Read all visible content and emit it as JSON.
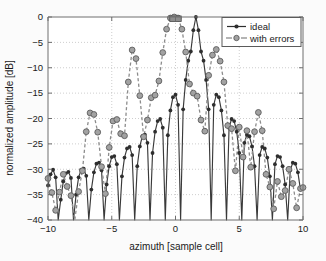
{
  "chart_data": {
    "type": "line",
    "title": "",
    "xlabel": "azimuth [sample cell]",
    "ylabel": "normalized amplitude [dB]",
    "xlim": [
      -10,
      10
    ],
    "ylim": [
      -40,
      0
    ],
    "xticks": [
      -10,
      -5,
      0,
      5,
      10
    ],
    "xtick_labels": [
      "-10",
      "-5",
      "0",
      "5",
      "10"
    ],
    "yticks": [
      0,
      -5,
      -10,
      -15,
      -20,
      -25,
      -30,
      -35,
      -40
    ],
    "ytick_labels": [
      "0",
      "-5",
      "-10",
      "-15",
      "-20",
      "-25",
      "-30",
      "-35",
      "-40"
    ],
    "grid": true,
    "grid_style": "dotted",
    "legend_position": "top-right",
    "series": [
      {
        "name": "ideal",
        "style": "solid",
        "marker": "dot",
        "color": "#2e2e2e",
        "x": [
          -10.0,
          -9.8,
          -9.6,
          -9.4,
          -9.2,
          -9.0,
          -8.8,
          -8.6,
          -8.4,
          -8.2,
          -8.0,
          -7.8,
          -7.6,
          -7.4,
          -7.2,
          -7.0,
          -6.8,
          -6.6,
          -6.4,
          -6.2,
          -6.0,
          -5.8,
          -5.6,
          -5.4,
          -5.2,
          -5.0,
          -4.8,
          -4.6,
          -4.4,
          -4.2,
          -4.0,
          -3.8,
          -3.6,
          -3.4,
          -3.2,
          -3.0,
          -2.8,
          -2.6,
          -2.4,
          -2.2,
          -2.0,
          -1.8,
          -1.6,
          -1.4,
          -1.2,
          -1.0,
          -0.8,
          -0.6,
          -0.4,
          -0.2,
          0.0,
          0.2,
          0.4,
          0.6,
          0.8,
          1.0,
          1.2,
          1.4,
          1.6,
          1.8,
          2.0,
          2.2,
          2.4,
          2.6,
          2.8,
          3.0,
          3.2,
          3.4,
          3.6,
          3.8,
          4.0,
          4.2,
          4.4,
          4.6,
          4.8,
          5.0,
          5.2,
          5.4,
          5.6,
          5.8,
          6.0,
          6.2,
          6.4,
          6.6,
          6.8,
          7.0,
          7.2,
          7.4,
          7.6,
          7.8,
          8.0,
          8.2,
          8.4,
          8.6,
          8.8,
          9.0,
          9.2,
          9.4,
          9.6,
          9.8,
          10.0
        ],
        "y": [
          -33.2,
          -31.0,
          -30.1,
          -31.6,
          -40.0,
          -36.0,
          -32.4,
          -30.8,
          -30.5,
          -31.7,
          -40.0,
          -35.0,
          -31.6,
          -30.1,
          -29.9,
          -31.3,
          -40.0,
          -34.0,
          -30.6,
          -28.9,
          -28.7,
          -30.2,
          -40.0,
          -33.0,
          -29.4,
          -27.6,
          -27.4,
          -29.0,
          -40.0,
          -31.4,
          -27.7,
          -25.9,
          -25.6,
          -27.2,
          -40.0,
          -29.4,
          -25.5,
          -23.5,
          -23.2,
          -24.8,
          -40.0,
          -26.8,
          -22.6,
          -20.5,
          -20.1,
          -21.8,
          -40.0,
          -23.3,
          -18.4,
          -15.8,
          -15.3,
          -17.3,
          -40.0,
          -18.2,
          -12.4,
          -8.6,
          -6.8,
          -2.6,
          0.0,
          -2.6,
          -6.8,
          -8.6,
          -12.4,
          -18.2,
          -40.0,
          -17.3,
          -15.3,
          -15.8,
          -18.4,
          -23.3,
          -40.0,
          -21.8,
          -20.1,
          -20.5,
          -22.6,
          -26.8,
          -40.0,
          -24.8,
          -23.2,
          -23.5,
          -25.5,
          -29.4,
          -40.0,
          -27.2,
          -25.6,
          -25.9,
          -27.7,
          -31.4,
          -40.0,
          -29.0,
          -27.4,
          -27.6,
          -29.4,
          -33.0,
          -40.0,
          -30.2,
          -28.7,
          -28.9,
          -30.6,
          -34.0,
          -33.5
        ]
      },
      {
        "name": "with errors",
        "style": "dashed",
        "marker": "circle",
        "color": "#a2a2a2",
        "x": [
          -10.0,
          -9.7,
          -9.4,
          -9.1,
          -8.8,
          -8.5,
          -8.2,
          -7.9,
          -7.6,
          -7.3,
          -7.0,
          -6.7,
          -6.4,
          -6.1,
          -5.8,
          -5.5,
          -5.2,
          -4.9,
          -4.6,
          -4.3,
          -4.0,
          -3.7,
          -3.4,
          -3.1,
          -2.8,
          -2.5,
          -2.2,
          -1.9,
          -1.6,
          -1.3,
          -1.0,
          -0.7,
          -0.4,
          -0.1,
          0.2,
          0.5,
          0.8,
          1.1,
          1.4,
          1.7,
          2.0,
          2.3,
          2.6,
          2.9,
          3.2,
          3.5,
          3.8,
          4.1,
          4.4,
          4.7,
          5.0,
          5.3,
          5.6,
          5.9,
          6.2,
          6.5,
          6.8,
          7.1,
          7.4,
          7.7,
          8.0,
          8.3,
          8.6,
          8.9,
          9.2,
          9.5,
          9.8,
          10.0
        ],
        "y": [
          -31.8,
          -34.6,
          -38.1,
          -34.5,
          -31.0,
          -33.4,
          -35.2,
          -40.0,
          -34.4,
          -30.3,
          -22.6,
          -18.9,
          -19.2,
          -22.7,
          -29.5,
          -34.8,
          -25.7,
          -20.5,
          -20.2,
          -23.0,
          -23.4,
          -12.8,
          -6.5,
          -8.2,
          -15.5,
          -23.6,
          -20.3,
          -15.9,
          -15.4,
          -12.6,
          -7.0,
          -2.4,
          -0.2,
          0.0,
          -0.2,
          -2.4,
          -6.9,
          -13.2,
          -15.0,
          -15.6,
          -20.3,
          -22.5,
          -11.5,
          -7.5,
          -6.4,
          -8.7,
          -12.8,
          -21.4,
          -22.0,
          -30.3,
          -21.7,
          -27.6,
          -22.4,
          -29.6,
          -22.6,
          -18.8,
          -22.4,
          -31.0,
          -33.5,
          -37.8,
          -32.4,
          -35.4,
          -34.2,
          -30.0,
          -32.8,
          -37.6,
          -33.8,
          -33.6
        ]
      }
    ]
  },
  "legend": {
    "entries": [
      {
        "label": "ideal"
      },
      {
        "label": "with errors"
      }
    ]
  }
}
